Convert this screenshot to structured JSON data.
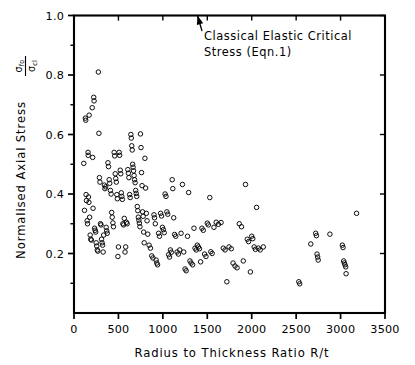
{
  "chart_data": {
    "type": "scatter",
    "title": "",
    "xlabel": "Radius to Thickness Ratio R/t",
    "ylabel": "Normalised Axial Stress",
    "ylabel_fraction": {
      "numerator": "σ",
      "numerator_sub": "fo",
      "denominator": "σ",
      "denominator_sub": "cl"
    },
    "xlim": [
      0,
      3500
    ],
    "ylim": [
      0.0,
      1.0
    ],
    "xticks": [
      0,
      500,
      1000,
      1500,
      2000,
      2500,
      3000,
      3500
    ],
    "xticklabels": [
      "0",
      "500",
      "1000",
      "1500",
      "2000",
      "2500",
      "3000",
      "3500"
    ],
    "yticks": [
      0.2,
      0.4,
      0.6,
      0.8,
      1.0
    ],
    "yticklabels": [
      "0.2",
      "0.4",
      "0.6",
      "0.8",
      "1.0"
    ],
    "grid": false,
    "legend": null,
    "marker": "open-circle",
    "marker_color": "#0d0d0d",
    "annotations": [
      {
        "text_line1": "Classical Elastic Critical",
        "text_line2": "Stress (Eqn.1)",
        "points_to_x": 1390,
        "points_to_y": 1.0
      }
    ],
    "points": [
      [
        110,
        0.503
      ],
      [
        118,
        0.345
      ],
      [
        128,
        0.655
      ],
      [
        132,
        0.648
      ],
      [
        136,
        0.398
      ],
      [
        140,
        0.378
      ],
      [
        148,
        0.31
      ],
      [
        152,
        0.3
      ],
      [
        158,
        0.54
      ],
      [
        160,
        0.53
      ],
      [
        163,
        0.39
      ],
      [
        168,
        0.372
      ],
      [
        170,
        0.665
      ],
      [
        176,
        0.322
      ],
      [
        182,
        0.262
      ],
      [
        188,
        0.248
      ],
      [
        196,
        0.245
      ],
      [
        205,
        0.69
      ],
      [
        210,
        0.523
      ],
      [
        214,
        0.352
      ],
      [
        222,
        0.725
      ],
      [
        226,
        0.713
      ],
      [
        232,
        0.285
      ],
      [
        238,
        0.278
      ],
      [
        244,
        0.272
      ],
      [
        250,
        0.236
      ],
      [
        256,
        0.225
      ],
      [
        262,
        0.212
      ],
      [
        268,
        0.208
      ],
      [
        274,
        0.81
      ],
      [
        280,
        0.604
      ],
      [
        286,
        0.455
      ],
      [
        292,
        0.44
      ],
      [
        298,
        0.3
      ],
      [
        304,
        0.296
      ],
      [
        310,
        0.248
      ],
      [
        316,
        0.236
      ],
      [
        322,
        0.228
      ],
      [
        328,
        0.205
      ],
      [
        334,
        0.262
      ],
      [
        342,
        0.43
      ],
      [
        348,
        0.418
      ],
      [
        356,
        0.424
      ],
      [
        362,
        0.288
      ],
      [
        368,
        0.276
      ],
      [
        374,
        0.268
      ],
      [
        382,
        0.505
      ],
      [
        388,
        0.492
      ],
      [
        396,
        0.448
      ],
      [
        402,
        0.436
      ],
      [
        410,
        0.412
      ],
      [
        418,
        0.4
      ],
      [
        424,
        0.338
      ],
      [
        430,
        0.322
      ],
      [
        438,
        0.303
      ],
      [
        444,
        0.29
      ],
      [
        452,
        0.54
      ],
      [
        458,
        0.528
      ],
      [
        464,
        0.468
      ],
      [
        470,
        0.452
      ],
      [
        476,
        0.44
      ],
      [
        482,
        0.398
      ],
      [
        488,
        0.384
      ],
      [
        494,
        0.19
      ],
      [
        500,
        0.222
      ],
      [
        508,
        0.54
      ],
      [
        514,
        0.53
      ],
      [
        520,
        0.48
      ],
      [
        526,
        0.468
      ],
      [
        532,
        0.404
      ],
      [
        538,
        0.392
      ],
      [
        544,
        0.382
      ],
      [
        550,
        0.3
      ],
      [
        558,
        0.296
      ],
      [
        566,
        0.318
      ],
      [
        574,
        0.205
      ],
      [
        582,
        0.222
      ],
      [
        590,
        0.305
      ],
      [
        598,
        0.3
      ],
      [
        606,
        0.482
      ],
      [
        612,
        0.47
      ],
      [
        618,
        0.455
      ],
      [
        626,
        0.398
      ],
      [
        632,
        0.388
      ],
      [
        640,
        0.6
      ],
      [
        645,
        0.588
      ],
      [
        650,
        0.562
      ],
      [
        655,
        0.548
      ],
      [
        660,
        0.5
      ],
      [
        665,
        0.49
      ],
      [
        670,
        0.478
      ],
      [
        676,
        0.462
      ],
      [
        682,
        0.448
      ],
      [
        688,
        0.438
      ],
      [
        694,
        0.412
      ],
      [
        700,
        0.402
      ],
      [
        706,
        0.392
      ],
      [
        712,
        0.358
      ],
      [
        718,
        0.344
      ],
      [
        724,
        0.322
      ],
      [
        730,
        0.312
      ],
      [
        736,
        0.302
      ],
      [
        742,
        0.29
      ],
      [
        748,
        0.602
      ],
      [
        754,
        0.556
      ],
      [
        760,
        0.472
      ],
      [
        766,
        0.428
      ],
      [
        772,
        0.34
      ],
      [
        778,
        0.325
      ],
      [
        784,
        0.272
      ],
      [
        790,
        0.236
      ],
      [
        798,
        0.52
      ],
      [
        806,
        0.42
      ],
      [
        814,
        0.335
      ],
      [
        822,
        0.31
      ],
      [
        830,
        0.265
      ],
      [
        845,
        0.228
      ],
      [
        860,
        0.218
      ],
      [
        875,
        0.192
      ],
      [
        888,
        0.185
      ],
      [
        900,
        0.33
      ],
      [
        906,
        0.32
      ],
      [
        915,
        0.3
      ],
      [
        924,
        0.178
      ],
      [
        932,
        0.168
      ],
      [
        940,
        0.162
      ],
      [
        952,
        0.268
      ],
      [
        962,
        0.258
      ],
      [
        975,
        0.335
      ],
      [
        985,
        0.326
      ],
      [
        995,
        0.288
      ],
      [
        1005,
        0.28
      ],
      [
        1015,
        0.27
      ],
      [
        1025,
        0.4
      ],
      [
        1035,
        0.392
      ],
      [
        1045,
        0.34
      ],
      [
        1055,
        0.332
      ],
      [
        1065,
        0.196
      ],
      [
        1075,
        0.188
      ],
      [
        1085,
        0.212
      ],
      [
        1095,
        0.204
      ],
      [
        1105,
        0.448
      ],
      [
        1112,
        0.418
      ],
      [
        1122,
        0.32
      ],
      [
        1132,
        0.264
      ],
      [
        1145,
        0.258
      ],
      [
        1160,
        0.205
      ],
      [
        1175,
        0.198
      ],
      [
        1190,
        0.212
      ],
      [
        1205,
        0.268
      ],
      [
        1220,
        0.432
      ],
      [
        1235,
        0.205
      ],
      [
        1250,
        0.148
      ],
      [
        1262,
        0.142
      ],
      [
        1278,
        0.258
      ],
      [
        1290,
        0.405
      ],
      [
        1305,
        0.175
      ],
      [
        1318,
        0.168
      ],
      [
        1335,
        0.162
      ],
      [
        1350,
        0.285
      ],
      [
        1362,
        0.218
      ],
      [
        1375,
        0.212
      ],
      [
        1388,
        0.228
      ],
      [
        1400,
        0.222
      ],
      [
        1412,
        0.216
      ],
      [
        1425,
        0.172
      ],
      [
        1440,
        0.285
      ],
      [
        1455,
        0.278
      ],
      [
        1470,
        0.198
      ],
      [
        1485,
        0.19
      ],
      [
        1500,
        0.302
      ],
      [
        1512,
        0.296
      ],
      [
        1528,
        0.388
      ],
      [
        1540,
        0.206
      ],
      [
        1555,
        0.2
      ],
      [
        1575,
        0.288
      ],
      [
        1600,
        0.305
      ],
      [
        1625,
        0.298
      ],
      [
        1655,
        0.304
      ],
      [
        1680,
        0.218
      ],
      [
        1700,
        0.212
      ],
      [
        1720,
        0.105
      ],
      [
        1745,
        0.222
      ],
      [
        1770,
        0.216
      ],
      [
        1790,
        0.168
      ],
      [
        1812,
        0.158
      ],
      [
        1835,
        0.152
      ],
      [
        1860,
        0.3
      ],
      [
        1885,
        0.29
      ],
      [
        1905,
        0.175
      ],
      [
        1930,
        0.432
      ],
      [
        1950,
        0.248
      ],
      [
        1965,
        0.24
      ],
      [
        1985,
        0.138
      ],
      [
        2000,
        0.258
      ],
      [
        2012,
        0.25
      ],
      [
        2028,
        0.222
      ],
      [
        2042,
        0.214
      ],
      [
        2055,
        0.355
      ],
      [
        2075,
        0.218
      ],
      [
        2095,
        0.212
      ],
      [
        2130,
        0.222
      ],
      [
        2530,
        0.105
      ],
      [
        2540,
        0.098
      ],
      [
        2665,
        0.232
      ],
      [
        2720,
        0.268
      ],
      [
        2728,
        0.26
      ],
      [
        2735,
        0.198
      ],
      [
        2742,
        0.188
      ],
      [
        2748,
        0.178
      ],
      [
        2880,
        0.265
      ],
      [
        3020,
        0.228
      ],
      [
        3028,
        0.22
      ],
      [
        3035,
        0.175
      ],
      [
        3042,
        0.168
      ],
      [
        3050,
        0.162
      ],
      [
        3058,
        0.155
      ],
      [
        3062,
        0.132
      ],
      [
        3180,
        0.335
      ]
    ]
  }
}
